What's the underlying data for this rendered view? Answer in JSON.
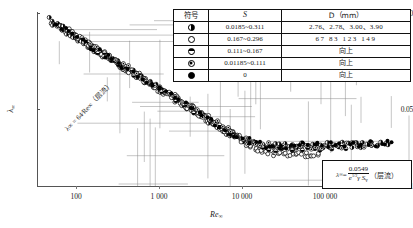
{
  "chart_data": {
    "type": "scatter",
    "title": "",
    "xlabel": "Re∞",
    "ylabel": "λ∞",
    "xscale": "log",
    "yscale": "log",
    "xlim": [
      60,
      300000
    ],
    "ylim": [
      0.0085,
      1.15
    ],
    "grid": true,
    "legend_position": "top-right",
    "xticks": [
      100,
      1000,
      10000,
      100000
    ],
    "xtick_labels": [
      "100",
      "1 000",
      "10 000",
      "100 000"
    ],
    "yticks": [
      1.0,
      0.05,
      0.01
    ],
    "ytick_labels": [
      "1.0",
      "0.05",
      "0.01"
    ],
    "annotations": [
      {
        "text": "λ∞ = 64/Re∞（层流）",
        "x": 400,
        "y": 0.09,
        "rotation": -46
      },
      {
        "text": "λ∞ = 0.0549 / (e^(1/2) γ Sv) （层流）",
        "x": 60000,
        "y": 0.016
      }
    ],
    "series": [
      {
        "name": "half-filled-vertical",
        "symbol": "half-filled-circle",
        "S": "0.0185~0.311",
        "D": "2.76、2.78、3.00、3.90",
        "points": [
          [
            80,
            0.92
          ],
          [
            95,
            0.8
          ],
          [
            110,
            0.72
          ],
          [
            130,
            0.62
          ],
          [
            160,
            0.52
          ],
          [
            200,
            0.44
          ],
          [
            260,
            0.36
          ],
          [
            330,
            0.3
          ],
          [
            430,
            0.24
          ],
          [
            560,
            0.2
          ],
          [
            720,
            0.165
          ],
          [
            950,
            0.135
          ],
          [
            1250,
            0.11
          ],
          [
            1650,
            0.088
          ],
          [
            2200,
            0.07
          ],
          [
            2900,
            0.056
          ],
          [
            3800,
            0.045
          ],
          [
            5000,
            0.037
          ],
          [
            6500,
            0.031
          ],
          [
            9000,
            0.027
          ],
          [
            13000,
            0.026
          ],
          [
            20000,
            0.026
          ],
          [
            32000,
            0.027
          ],
          [
            50000,
            0.027
          ],
          [
            80000,
            0.027
          ],
          [
            130000,
            0.027
          ],
          [
            200000,
            0.028
          ]
        ]
      },
      {
        "name": "open-circle",
        "symbol": "open-circle",
        "S": "0.167~0.296",
        "D": "67  83  123  149",
        "points": [
          [
            120,
            0.7
          ],
          [
            170,
            0.52
          ],
          [
            240,
            0.4
          ],
          [
            340,
            0.29
          ],
          [
            480,
            0.22
          ],
          [
            680,
            0.17
          ],
          [
            960,
            0.13
          ],
          [
            1400,
            0.1
          ],
          [
            2000,
            0.078
          ],
          [
            2800,
            0.06
          ],
          [
            3900,
            0.046
          ],
          [
            5400,
            0.036
          ],
          [
            7500,
            0.028
          ],
          [
            10000,
            0.023
          ],
          [
            14000,
            0.021
          ],
          [
            20000,
            0.021
          ],
          [
            28000,
            0.021
          ],
          [
            40000,
            0.021
          ]
        ]
      },
      {
        "name": "bottom-half-filled",
        "symbol": "bottom-half-circle",
        "S": "0.111~0.167",
        "D": "向上",
        "points": [
          [
            150,
            0.58
          ],
          [
            300,
            0.33
          ],
          [
            600,
            0.19
          ],
          [
            1200,
            0.115
          ],
          [
            2400,
            0.067
          ],
          [
            4800,
            0.04
          ],
          [
            9600,
            0.026
          ],
          [
            19000,
            0.024
          ],
          [
            38000,
            0.025
          ],
          [
            76000,
            0.026
          ]
        ]
      },
      {
        "name": "dotted-circle",
        "symbol": "dot-circle",
        "S": "0.01185~0.111",
        "D": "向上",
        "points": [
          [
            200,
            0.46
          ],
          [
            420,
            0.26
          ],
          [
            880,
            0.15
          ],
          [
            1800,
            0.09
          ],
          [
            3700,
            0.05
          ],
          [
            7600,
            0.03
          ],
          [
            16000,
            0.025
          ],
          [
            33000,
            0.026
          ],
          [
            68000,
            0.027
          ],
          [
            140000,
            0.027
          ]
        ]
      },
      {
        "name": "filled-circle",
        "symbol": "filled-circle",
        "S": "0",
        "D": "向上",
        "points": [
          [
            90,
            0.86
          ],
          [
            180,
            0.5
          ],
          [
            360,
            0.28
          ],
          [
            750,
            0.16
          ],
          [
            1500,
            0.098
          ],
          [
            3100,
            0.054
          ],
          [
            6300,
            0.032
          ],
          [
            13000,
            0.026
          ],
          [
            26000,
            0.027
          ],
          [
            55000,
            0.028
          ],
          [
            110000,
            0.028
          ],
          [
            220000,
            0.028
          ]
        ]
      }
    ]
  },
  "legend": {
    "headers": [
      "符号",
      "S",
      "D（mm）"
    ],
    "rows": [
      {
        "symbol": "half-filled-circle",
        "s": "0.0185~0.311",
        "d": "2.76、2.78、3.00、3.90"
      },
      {
        "symbol": "open-circle",
        "s": "0.167~0.296",
        "d": "67   83    123    149"
      },
      {
        "symbol": "bottom-half-circle",
        "s": "0.111~0.167",
        "d": "向上"
      },
      {
        "symbol": "dot-circle",
        "s": "0.01185~0.111",
        "d": "向上"
      },
      {
        "symbol": "filled-circle",
        "s": "0",
        "d": "向上"
      }
    ]
  },
  "formula_box": {
    "lhs": "λ",
    "lhs_sub": "∞",
    "equals": "=",
    "numerator": "0.0549",
    "denominator_base": "e",
    "denominator_exp": "1/2",
    "denominator_rest": "γ S",
    "denominator_rest_sub": "v",
    "suffix": "（层流）"
  },
  "inline_annotation": {
    "text": "λ∞ = 64∕Re∞（层流）"
  },
  "axes": {
    "y_title": "λ",
    "y_title_sub": "∞",
    "x_title": "Re",
    "x_title_sub": "∞",
    "ytick_labels": [
      "1.0",
      "0.05",
      "0.01"
    ],
    "xtick_labels": [
      "100",
      "1 000",
      "10 000",
      "100 000"
    ]
  }
}
